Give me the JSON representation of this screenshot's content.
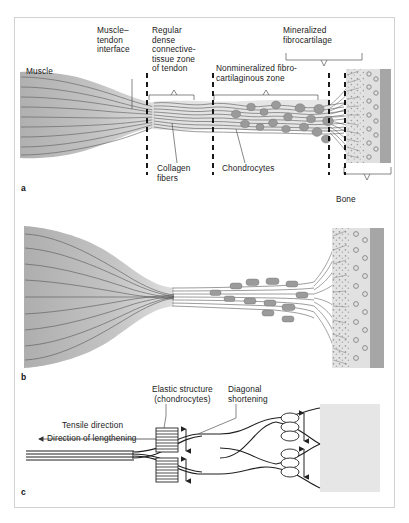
{
  "figure": {
    "background_color": "#ffffff",
    "frame_color": "#d2d2d2"
  },
  "panels": [
    {
      "letter": "a",
      "name": "zones-of-the-tendon-bone-junction",
      "labels": [
        {
          "id": "muscle",
          "text": "Muscle",
          "x": 26,
          "y": 72
        },
        {
          "id": "muscle-tendon-interface",
          "text": "Muscle–\ntendon\ninterface",
          "x": 97,
          "y": 28
        },
        {
          "id": "regular-dense-connective-tissue-zone",
          "text": "Regular\ndense\nconnective-\ntissue zone\nof tendon",
          "x": 152,
          "y": 28
        },
        {
          "id": "nonmineralized-fibrocartilaginous-zone",
          "text": "Nonmineralized fibro-\ncartilaginous zone",
          "x": 216,
          "y": 66
        },
        {
          "id": "mineralized-fibrocartilage",
          "text": "Mineralized\nfibrocartilage",
          "x": 283,
          "y": 28
        },
        {
          "id": "collagen-fibers",
          "text": "Collagen\nfibers",
          "x": 157,
          "y": 167
        },
        {
          "id": "chondrocytes",
          "text": "Chondrocytes",
          "x": 223,
          "y": 167
        },
        {
          "id": "bone",
          "text": "Bone",
          "x": 336,
          "y": 200
        }
      ]
    },
    {
      "letter": "b",
      "name": "whole-muscle-tendon-bone-unit",
      "labels": []
    },
    {
      "letter": "c",
      "name": "mechanical-model-of-elastic-shortening",
      "labels": [
        {
          "id": "elastic-structure-chondrocytes",
          "text": "Elastic structure\n(chondrocytes)",
          "x": 152,
          "y": 388
        },
        {
          "id": "diagonal-shortening",
          "text": "Diagonal\nshortening",
          "x": 228,
          "y": 388
        },
        {
          "id": "tensile-direction",
          "text": "Tensile direction",
          "x": 62,
          "y": 424
        },
        {
          "id": "direction-of-lengthening",
          "text": "Direction of lengthening",
          "x": 47,
          "y": 437
        }
      ]
    }
  ],
  "colors": {
    "muscle_fill": "#b4b4b4",
    "tendon_fill": "#d8d8d8",
    "chondrocyte_fill": "#9a9a9a",
    "bone_solid": "#a0a0a0",
    "bone_matrix": "#dcdcdc",
    "osteocyte_ring": "#8c8c8c",
    "line": "#2b2b2b",
    "text": "#1b1b1b"
  }
}
